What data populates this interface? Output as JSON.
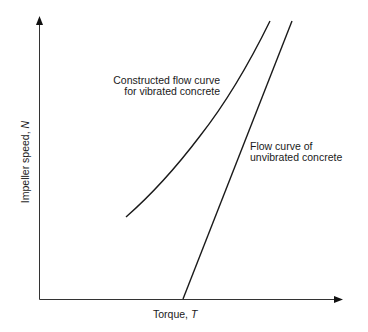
{
  "diagram": {
    "type": "flow-curve-plot",
    "axes": {
      "x_label": "Torque, ",
      "x_symbol": "T",
      "y_label": "Impeller speed, ",
      "y_symbol": "N",
      "ticks": "none"
    },
    "curves": [
      {
        "name": "vibrated",
        "label_line1": "Constructed flow curve",
        "label_line2": "for vibrated concrete",
        "shape": "concave-up curve starting mid-plot, no intercept"
      },
      {
        "name": "unvibrated",
        "label_line1": "Flow curve of",
        "label_line2": "unvibrated concrete",
        "shape": "straight line with positive torque intercept"
      }
    ],
    "line_color": "#1a1a1a"
  }
}
